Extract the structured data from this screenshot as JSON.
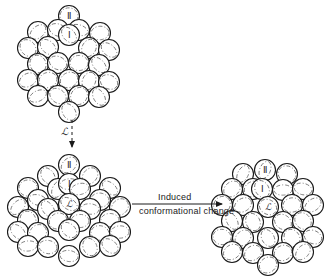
{
  "figure": {
    "title": "Induced conformational change of a packed subunit cluster",
    "background_color": "#ffffff",
    "stroke_color": "#1a1a1a",
    "dashed_color": "#6b6b6b",
    "circle_radius": 10.5,
    "circle_stroke_width": 1.1,
    "dash_stroke_width": 0.8
  },
  "labels": {
    "roman_two": "Ⅱ",
    "roman_one": "Ⅰ",
    "script_l": "ℒ"
  },
  "arrows": {
    "vertical": {
      "label": "ℒ",
      "style": "dashed",
      "direction": "down",
      "x": 72,
      "y_start": 120,
      "y_end": 150,
      "label_x": 68,
      "label_y": 135
    },
    "horizontal": {
      "label_line_1": "Induced",
      "label_line_2": "conformational change",
      "style": "solid",
      "direction": "right",
      "x_start": 132,
      "x_end": 222,
      "y": 204
    }
  },
  "clusters": [
    {
      "name": "top-cluster",
      "center_x": 69,
      "center_y": 62,
      "labelled_circles": [
        {
          "label": "Ⅱ",
          "x": 69,
          "y": 16
        },
        {
          "label": "Ⅰ",
          "x": 69,
          "y": 35
        }
      ],
      "circles": [
        {
          "x": 69,
          "y": 16
        },
        {
          "x": 38,
          "y": 32
        },
        {
          "x": 58,
          "y": 30
        },
        {
          "x": 79,
          "y": 30
        },
        {
          "x": 100,
          "y": 33
        },
        {
          "x": 69,
          "y": 35
        },
        {
          "x": 28,
          "y": 48
        },
        {
          "x": 48,
          "y": 47
        },
        {
          "x": 89,
          "y": 48
        },
        {
          "x": 109,
          "y": 50
        },
        {
          "x": 38,
          "y": 64
        },
        {
          "x": 58,
          "y": 63
        },
        {
          "x": 79,
          "y": 63
        },
        {
          "x": 99,
          "y": 65
        },
        {
          "x": 28,
          "y": 80
        },
        {
          "x": 48,
          "y": 80
        },
        {
          "x": 69,
          "y": 80
        },
        {
          "x": 89,
          "y": 81
        },
        {
          "x": 109,
          "y": 82
        },
        {
          "x": 38,
          "y": 96
        },
        {
          "x": 58,
          "y": 96
        },
        {
          "x": 79,
          "y": 96
        },
        {
          "x": 99,
          "y": 97
        },
        {
          "x": 69,
          "y": 112
        }
      ]
    },
    {
      "name": "bottom-left-cluster",
      "center_x": 69,
      "center_y": 208,
      "labelled_circles": [
        {
          "label": "Ⅱ",
          "x": 69,
          "y": 165
        },
        {
          "label": "Ⅰ",
          "x": 69,
          "y": 184
        },
        {
          "label": "ℒ",
          "x": 69,
          "y": 204
        }
      ],
      "circles": [
        {
          "x": 69,
          "y": 165
        },
        {
          "x": 48,
          "y": 176
        },
        {
          "x": 90,
          "y": 176
        },
        {
          "x": 28,
          "y": 188
        },
        {
          "x": 58,
          "y": 189
        },
        {
          "x": 69,
          "y": 184
        },
        {
          "x": 80,
          "y": 189
        },
        {
          "x": 110,
          "y": 188
        },
        {
          "x": 38,
          "y": 200
        },
        {
          "x": 100,
          "y": 200
        },
        {
          "x": 18,
          "y": 207
        },
        {
          "x": 48,
          "y": 209
        },
        {
          "x": 69,
          "y": 204
        },
        {
          "x": 90,
          "y": 209
        },
        {
          "x": 120,
          "y": 207
        },
        {
          "x": 28,
          "y": 220
        },
        {
          "x": 58,
          "y": 221
        },
        {
          "x": 80,
          "y": 221
        },
        {
          "x": 110,
          "y": 220
        },
        {
          "x": 18,
          "y": 232
        },
        {
          "x": 38,
          "y": 233
        },
        {
          "x": 69,
          "y": 230
        },
        {
          "x": 100,
          "y": 233
        },
        {
          "x": 120,
          "y": 232
        },
        {
          "x": 28,
          "y": 246
        },
        {
          "x": 48,
          "y": 247
        },
        {
          "x": 90,
          "y": 247
        },
        {
          "x": 110,
          "y": 246
        },
        {
          "x": 69,
          "y": 256
        }
      ]
    },
    {
      "name": "right-cluster",
      "center_x": 268,
      "center_y": 208,
      "labelled_circles": [
        {
          "label": "Ⅱ",
          "x": 265,
          "y": 170
        },
        {
          "label": "Ⅰ",
          "x": 262,
          "y": 189
        },
        {
          "label": "ℒ",
          "x": 268,
          "y": 207
        }
      ],
      "circles": [
        {
          "x": 265,
          "y": 170
        },
        {
          "x": 243,
          "y": 174
        },
        {
          "x": 287,
          "y": 174
        },
        {
          "x": 232,
          "y": 189
        },
        {
          "x": 253,
          "y": 189
        },
        {
          "x": 262,
          "y": 189
        },
        {
          "x": 283,
          "y": 190
        },
        {
          "x": 303,
          "y": 189
        },
        {
          "x": 222,
          "y": 205
        },
        {
          "x": 243,
          "y": 205
        },
        {
          "x": 268,
          "y": 207
        },
        {
          "x": 292,
          "y": 205
        },
        {
          "x": 313,
          "y": 205
        },
        {
          "x": 232,
          "y": 221
        },
        {
          "x": 253,
          "y": 222
        },
        {
          "x": 283,
          "y": 222
        },
        {
          "x": 303,
          "y": 221
        },
        {
          "x": 222,
          "y": 237
        },
        {
          "x": 243,
          "y": 238
        },
        {
          "x": 268,
          "y": 238
        },
        {
          "x": 292,
          "y": 238
        },
        {
          "x": 313,
          "y": 237
        },
        {
          "x": 232,
          "y": 252
        },
        {
          "x": 253,
          "y": 253
        },
        {
          "x": 283,
          "y": 253
        },
        {
          "x": 303,
          "y": 252
        },
        {
          "x": 268,
          "y": 265
        }
      ]
    }
  ]
}
